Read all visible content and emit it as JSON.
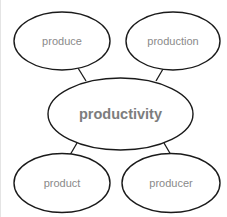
{
  "diagram": {
    "type": "word-web",
    "center": {
      "label": "productivity"
    },
    "nodes": [
      {
        "label": "produce"
      },
      {
        "label": "production"
      },
      {
        "label": "product"
      },
      {
        "label": "producer"
      }
    ],
    "colors": {
      "stroke": "#1a1a1a",
      "text": "#8a8a8a",
      "background": "#ffffff"
    }
  }
}
